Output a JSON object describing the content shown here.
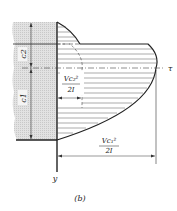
{
  "figure": {
    "caption": "(b)",
    "labels": {
      "c2": "c2",
      "c1": "c1",
      "tau": "τ",
      "y_axis": "y",
      "inner_numerator": "Vc₂²",
      "inner_denominator": "2I",
      "outer_numerator": "Vc₁²",
      "outer_denominator": "2I"
    },
    "colors": {
      "line": "#222222",
      "hatch_fill": "#d9d9d9",
      "background": "#ffffff"
    }
  }
}
